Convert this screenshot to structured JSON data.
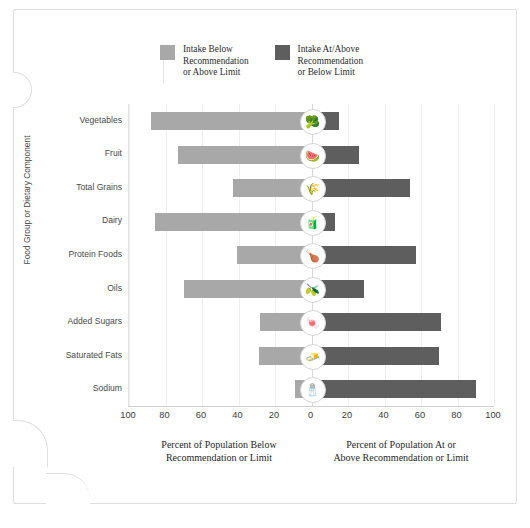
{
  "legend": {
    "items": [
      {
        "label": "Intake Below\nRecommendation\nor Above Limit",
        "color": "#a8a8a8",
        "name": "below-recommendation"
      },
      {
        "label": "Intake At/Above\nRecommendation\nor Below Limit",
        "color": "#5e5e5e",
        "name": "at-above-recommendation"
      }
    ]
  },
  "chart_data": {
    "type": "bar",
    "orientation": "horizontal",
    "style": "diverging",
    "title": "",
    "xlabel_left": "Percent of Population Below\nRecommendation or Limit",
    "xlabel_right": "Percent of Population At or\nAbove Recommendation or Limit",
    "ylabel": "Food Group or Dietary Component",
    "xlim": [
      -100,
      100
    ],
    "xticks": [
      100,
      80,
      60,
      40,
      20,
      0,
      20,
      40,
      60,
      80,
      100
    ],
    "grid": true,
    "legend_position": "top",
    "categories": [
      "Vegetables",
      "Fruit",
      "Total Grains",
      "Dairy",
      "Protein Foods",
      "Oils",
      "Added Sugars",
      "Saturated Fats",
      "Sodium"
    ],
    "series": [
      {
        "name": "Intake Below Recommendation or Above Limit",
        "color": "#a8a8a8",
        "values": [
          88,
          73,
          43,
          86,
          41,
          70,
          28,
          29,
          9
        ]
      },
      {
        "name": "Intake At/Above Recommendation or Below Limit",
        "color": "#5e5e5e",
        "values": [
          15,
          26,
          54,
          13,
          57,
          29,
          71,
          70,
          90
        ]
      }
    ],
    "row_icons": [
      {
        "category": "Vegetables",
        "icon": "broccoli-icon",
        "glyph": "🥦"
      },
      {
        "category": "Fruit",
        "icon": "fruit-slice-icon",
        "glyph": "🍉"
      },
      {
        "category": "Total Grains",
        "icon": "grain-stalk-icon",
        "glyph": "🌾"
      },
      {
        "category": "Dairy",
        "icon": "milk-carton-icon",
        "glyph": "🧃"
      },
      {
        "category": "Protein Foods",
        "icon": "protein-meat-icon",
        "glyph": "🍗"
      },
      {
        "category": "Oils",
        "icon": "oil-bottle-icon",
        "glyph": "🫒"
      },
      {
        "category": "Added Sugars",
        "icon": "sugar-cubes-icon",
        "glyph": "🍬"
      },
      {
        "category": "Saturated Fats",
        "icon": "butter-stick-icon",
        "glyph": "🧈"
      },
      {
        "category": "Sodium",
        "icon": "salt-shaker-icon",
        "glyph": "🧂"
      }
    ]
  },
  "colors": {
    "light_bar": "#a8a8a8",
    "dark_bar": "#5e5e5e",
    "grid": "#eeeeee",
    "zero_line": "#d8d8d8",
    "frame": "#dedede",
    "background": "#ffffff"
  }
}
